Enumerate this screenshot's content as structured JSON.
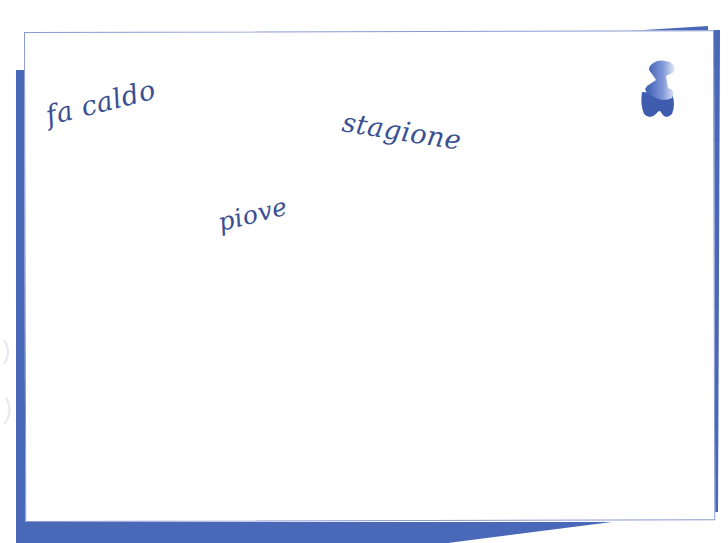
{
  "card": {
    "words": [
      {
        "text": "fa caldo"
      },
      {
        "text": "stagione"
      },
      {
        "text": "piove"
      }
    ]
  },
  "icons": {
    "pushpin": "pushpin-icon"
  },
  "colors": {
    "backing": "#4a68b8",
    "text": "#3b4f93",
    "card_border": "#8a9bd0",
    "card": "#ffffff"
  }
}
